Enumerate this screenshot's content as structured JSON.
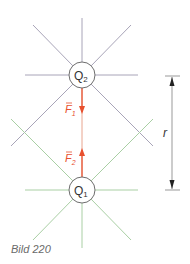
{
  "figure": {
    "caption": "Bild 220",
    "charges": [
      {
        "id": "Q2",
        "label": "Q",
        "subscript": "2",
        "cx": 82,
        "cy": 75,
        "r": 13,
        "field_color": "#a8a4b8"
      },
      {
        "id": "Q1",
        "label": "Q",
        "subscript": "1",
        "cx": 82,
        "cy": 190,
        "r": 13,
        "field_color": "#a9cfa4"
      }
    ],
    "forces": [
      {
        "id": "F1",
        "label": "F",
        "subscript": "1",
        "direction": "down",
        "color": "#e8502e"
      },
      {
        "id": "F2",
        "label": "F",
        "subscript": "2",
        "direction": "up",
        "color": "#e8502e"
      }
    ],
    "distance": {
      "label": "r",
      "color": "#555555"
    },
    "colors": {
      "charge_outline": "#6e6e6e",
      "force": "#e8502e",
      "q2_field": "#a8a4b8",
      "q1_field": "#a9cfa4"
    }
  }
}
